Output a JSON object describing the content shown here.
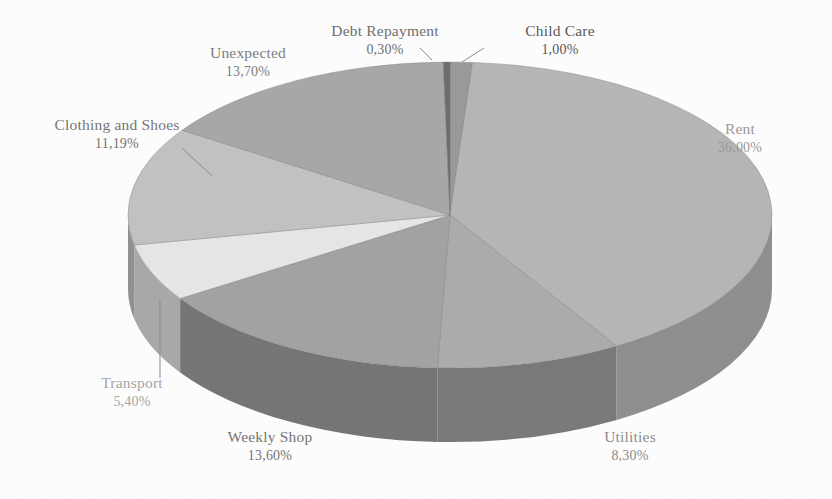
{
  "chart_data": {
    "type": "pie",
    "title": "",
    "subtitle": "",
    "xlabel": "",
    "ylabel": "",
    "legend_position": "none",
    "grid": false,
    "three_d": true,
    "value_format": "comma-decimal-percent",
    "categories": [
      "Child Care",
      "Rent",
      "Utilities",
      "Weekly Shop",
      "Transport",
      "Clothing and Shoes",
      "Unexpected",
      "Debt Repayment"
    ],
    "values": [
      1.0,
      36.0,
      8.3,
      13.6,
      5.4,
      11.19,
      13.7,
      0.3
    ],
    "labels_pct": [
      "1,00%",
      "36,00%",
      "8,30%",
      "13,60%",
      "5,40%",
      "11,19%",
      "13,70%",
      "0,30%"
    ],
    "colors": [
      "#9a9a9a",
      "#b6b6b6",
      "#acacac",
      "#a3a3a3",
      "#e6e6e6",
      "#c2c2c2",
      "#a8a8a8",
      "#6d6d6d"
    ],
    "slices": [
      {
        "name": "Child Care",
        "pct": "1,00%",
        "value": 1.0,
        "color": "#9a9a9a",
        "side_color": "#7d7d7d"
      },
      {
        "name": "Rent",
        "pct": "36,00%",
        "value": 36.0,
        "color": "#b6b6b6",
        "side_color": "#8f8f8f"
      },
      {
        "name": "Utilities",
        "pct": "8,30%",
        "value": 8.3,
        "color": "#acacac",
        "side_color": "#7a7a7a"
      },
      {
        "name": "Weekly Shop",
        "pct": "13,60%",
        "value": 13.6,
        "color": "#a3a3a3",
        "side_color": "#767676"
      },
      {
        "name": "Transport",
        "pct": "5,40%",
        "value": 5.4,
        "color": "#e6e6e6",
        "side_color": "#a9a9a9"
      },
      {
        "name": "Clothing and Shoes",
        "pct": "11,19%",
        "value": 11.19,
        "color": "#c2c2c2",
        "side_color": "#919191"
      },
      {
        "name": "Unexpected",
        "pct": "13,70%",
        "value": 13.7,
        "color": "#a8a8a8",
        "side_color": "#7f7f7f"
      },
      {
        "name": "Debt Repayment",
        "pct": "0,30%",
        "value": 0.3,
        "color": "#6d6d6d",
        "side_color": "#5c5c5c"
      }
    ]
  },
  "labels": {
    "debt_repayment": {
      "name": "Debt Repayment",
      "pct": "0,30%"
    },
    "child_care": {
      "name": "Child Care",
      "pct": "1,00%"
    },
    "unexpected": {
      "name": "Unexpected",
      "pct": "13,70%"
    },
    "clothing_and_shoes": {
      "name": "Clothing and Shoes",
      "pct": "11,19%"
    },
    "transport": {
      "name": "Transport",
      "pct": "5,40%"
    },
    "weekly_shop": {
      "name": "Weekly Shop",
      "pct": "13,60%"
    },
    "utilities": {
      "name": "Utilities",
      "pct": "8,30%"
    },
    "rent": {
      "name": "Rent",
      "pct": "36,00%"
    }
  },
  "style": {
    "background": "#fdfdfd",
    "label_color": "#6f6f6f",
    "leader_color": "#8d8d8d"
  }
}
